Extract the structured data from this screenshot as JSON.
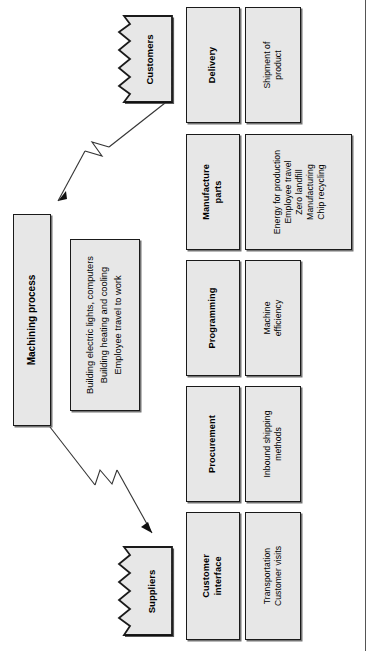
{
  "diagram": {
    "orientation": "rotated-90",
    "colors": {
      "box_fill": "#e7e7e7",
      "box_border": "#1a1a1a",
      "connector": "#333333",
      "page_rule": "#555555"
    },
    "core": {
      "process_label": "Machining process",
      "process_details": [
        "Building electric lights, computers",
        "Building heating and cooling",
        "Employee travel to work"
      ]
    },
    "endpoints": [
      {
        "id": "customers",
        "label": "Customers"
      },
      {
        "id": "suppliers",
        "label": "Suppliers"
      }
    ],
    "stages": [
      {
        "id": "delivery",
        "header": "Delivery",
        "details": [
          "Shipment of",
          "product"
        ]
      },
      {
        "id": "manufacture-parts",
        "header_lines": [
          "Manufacture",
          "parts"
        ],
        "details": [
          "Energy for production",
          "Employee travel",
          "Zero landfill",
          "Manufacturing",
          "Chip recycling"
        ]
      },
      {
        "id": "programming",
        "header": "Programming",
        "details": [
          "Machine",
          "efficiency"
        ]
      },
      {
        "id": "procurement",
        "header": "Procurement",
        "details": [
          "Inbound shipping",
          "methods"
        ]
      },
      {
        "id": "customer-interface",
        "header_lines": [
          "Customer",
          "interface"
        ],
        "details": [
          "Transportation",
          "Customer visits"
        ]
      }
    ]
  }
}
